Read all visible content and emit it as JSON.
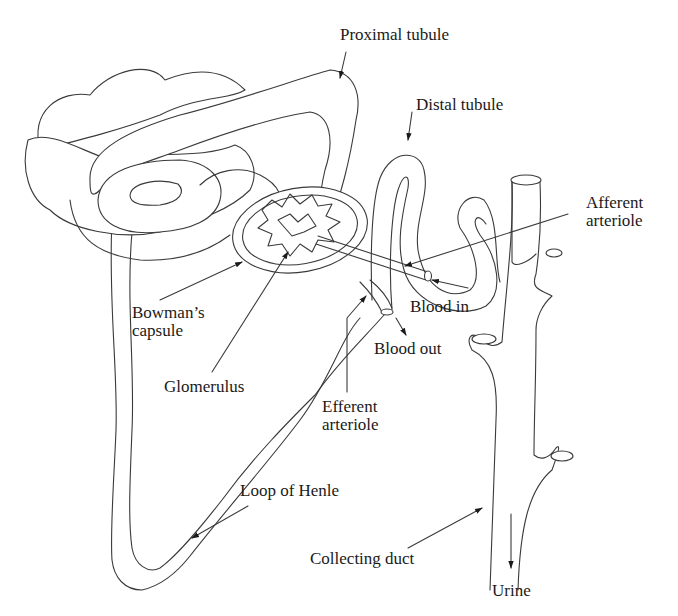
{
  "diagram": {
    "type": "nephron anatomy",
    "stroke_color": "#3a3a3a",
    "background": "#ffffff",
    "labels": {
      "proximal_tubule": "Proximal tubule",
      "distal_tubule": "Distal tubule",
      "afferent_arteriole": [
        "Afferent",
        "arteriole"
      ],
      "bowmans_capsule": [
        "Bowman’s",
        "capsule"
      ],
      "blood_in": "Blood in",
      "blood_out": "Blood out",
      "glomerulus": "Glomerulus",
      "efferent_arteriole": [
        "Efferent",
        "arteriole"
      ],
      "loop_of_henle": "Loop of Henle",
      "collecting_duct": "Collecting duct",
      "urine": "Urine"
    }
  }
}
